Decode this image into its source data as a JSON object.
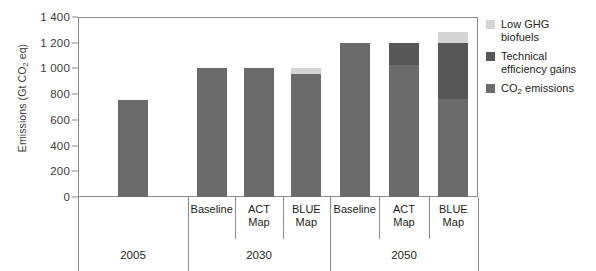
{
  "chart_data": {
    "type": "bar",
    "subtype": "stacked-bar-grouped",
    "title": "",
    "xlabel": "",
    "ylabel": "Emissions (Gt CO2 eq)",
    "ylabel_parts": {
      "pre": "Emissions (Gt CO",
      "sub": "2",
      "post": " eq)"
    },
    "ylim": [
      0,
      1400
    ],
    "ytick_step": 200,
    "ytick_labels": [
      "1 400",
      "1 200",
      "1 000",
      "800",
      "600",
      "400",
      "200",
      "0"
    ],
    "ytick_values": [
      1400,
      1200,
      1000,
      800,
      600,
      400,
      200,
      0
    ],
    "grid": false,
    "legend_position": "right",
    "groups": [
      {
        "year": "2005",
        "scenarios": [
          "",
          ""
        ]
      },
      {
        "year": "2030",
        "scenarios": [
          "Baseline",
          "ACT Map",
          "BLUE Map"
        ]
      },
      {
        "year": "2050",
        "scenarios": [
          "Baseline",
          "ACT Map",
          "BLUE Map"
        ]
      }
    ],
    "series": [
      {
        "name": "CO2 emissions",
        "color": "#6b6b6b",
        "values": [
          755,
          1000,
          1000,
          960,
          1200,
          1030,
          760
        ]
      },
      {
        "name": "Technical efficiency gains",
        "color": "#575757",
        "values": [
          0,
          0,
          0,
          0,
          0,
          170,
          440
        ]
      },
      {
        "name": "Low GHG biofuels",
        "color": "#d4d4d4",
        "values": [
          0,
          0,
          0,
          40,
          0,
          0,
          80
        ]
      }
    ],
    "bars": [
      {
        "group": "2005",
        "scenario": "",
        "segments": [
          {
            "series": "CO2 emissions",
            "value": 755
          }
        ],
        "total": 755
      },
      {
        "group": "2030",
        "scenario": "Baseline",
        "segments": [
          {
            "series": "CO2 emissions",
            "value": 1000
          }
        ],
        "total": 1000
      },
      {
        "group": "2030",
        "scenario": "ACT Map",
        "segments": [
          {
            "series": "CO2 emissions",
            "value": 1000
          }
        ],
        "total": 1000
      },
      {
        "group": "2030",
        "scenario": "BLUE Map",
        "segments": [
          {
            "series": "CO2 emissions",
            "value": 960
          },
          {
            "series": "Low GHG biofuels",
            "value": 40
          }
        ],
        "total": 1000
      },
      {
        "group": "2050",
        "scenario": "Baseline",
        "segments": [
          {
            "series": "CO2 emissions",
            "value": 1200
          }
        ],
        "total": 1200
      },
      {
        "group": "2050",
        "scenario": "ACT Map",
        "segments": [
          {
            "series": "CO2 emissions",
            "value": 1030
          },
          {
            "series": "Technical efficiency gains",
            "value": 170
          }
        ],
        "total": 1200
      },
      {
        "group": "2050",
        "scenario": "BLUE Map",
        "segments": [
          {
            "series": "CO2 emissions",
            "value": 760
          },
          {
            "series": "Technical efficiency gains",
            "value": 440
          },
          {
            "series": "Low GHG biofuels",
            "value": 80
          }
        ],
        "total": 1280
      }
    ]
  },
  "legend": {
    "items": [
      {
        "label_pre": "Low GHG",
        "label_post": "biofuels",
        "sub": "",
        "color": "#d4d4d4",
        "name": "low-ghg-biofuels"
      },
      {
        "label_pre": "Technical",
        "label_post": "efficiency gains",
        "sub": "",
        "color": "#575757",
        "name": "technical-efficiency-gains"
      },
      {
        "label_pre": "CO",
        "sub": "2",
        "label_post": " emissions",
        "color": "#6b6b6b",
        "name": "co2-emissions"
      }
    ]
  },
  "colors": {
    "co2_emissions": "#6b6b6b",
    "technical_efficiency_gains": "#575757",
    "low_ghg_biofuels": "#d4d4d4",
    "axis": "#8c8c8c",
    "text": "#231f20"
  }
}
